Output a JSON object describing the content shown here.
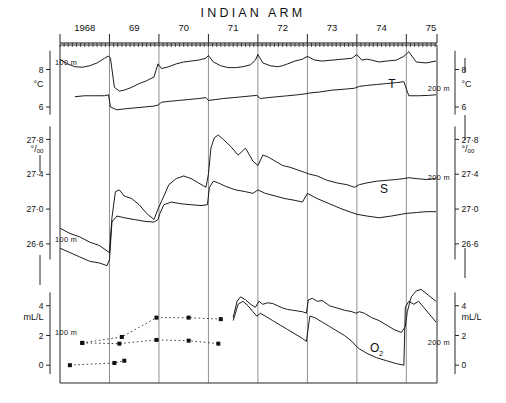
{
  "figure": {
    "title": "INDIAN ARM",
    "panel_labels": {
      "temperature": "T",
      "salinity": "S",
      "oxygen": "O",
      "oxygen_sub": "2"
    },
    "depth_labels": {
      "shallow": "100 m",
      "deep": "200 m"
    }
  },
  "chart_data": {
    "type": "line",
    "title": "INDIAN ARM",
    "xlabel": "",
    "ylabel": "",
    "grid": false,
    "legend": "none",
    "x_axis": {
      "tick_labels": [
        "1968",
        "69",
        "70",
        "71",
        "72",
        "73",
        "74",
        "75"
      ],
      "minor_ticks": "monthly",
      "range": [
        "1968.0",
        "1975.6"
      ]
    },
    "panels": [
      {
        "name": "temperature",
        "label": "T",
        "left_axis": {
          "units": "°C",
          "ticks": [
            "8",
            "6"
          ],
          "depth": "100 m"
        },
        "right_axis": {
          "units": "°C",
          "ticks": [
            "8",
            "6"
          ],
          "depth": "200 m"
        },
        "ylim": [
          5.2,
          9.2
        ],
        "series": [
          {
            "name": "100 m",
            "style": "solid",
            "x": [
              1968.0,
              1968.15,
              1968.3,
              1968.45,
              1968.6,
              1968.75,
              1968.9,
              1968.98,
              1969.02,
              1969.1,
              1969.2,
              1969.3,
              1969.45,
              1969.6,
              1969.75,
              1969.9,
              1969.98,
              1970.05,
              1970.2,
              1970.35,
              1970.5,
              1970.65,
              1970.8,
              1970.95,
              1971.0,
              1971.1,
              1971.25,
              1971.4,
              1971.55,
              1971.7,
              1971.85,
              1971.95,
              1972.0,
              1972.1,
              1972.25,
              1972.4,
              1972.5,
              1972.6,
              1972.75,
              1972.9,
              1973.0,
              1973.15,
              1973.3,
              1973.5,
              1973.7,
              1973.9,
              1974.0,
              1974.1,
              1974.2,
              1974.3,
              1974.45,
              1974.6,
              1974.8,
              1974.95,
              1975.05,
              1975.2,
              1975.4,
              1975.6
            ],
            "y": [
              8.55,
              8.3,
              8.15,
              8.12,
              8.2,
              8.35,
              8.6,
              8.72,
              8.6,
              7.05,
              6.85,
              6.9,
              7.05,
              7.25,
              7.4,
              7.6,
              8.3,
              8.05,
              8.15,
              8.3,
              8.4,
              8.45,
              8.5,
              8.6,
              8.75,
              8.4,
              8.2,
              8.1,
              8.1,
              8.15,
              8.25,
              8.5,
              8.8,
              8.35,
              8.2,
              8.15,
              8.2,
              8.3,
              8.45,
              8.55,
              8.7,
              8.5,
              8.45,
              8.5,
              8.55,
              8.6,
              8.8,
              8.5,
              8.55,
              8.5,
              8.4,
              8.45,
              8.5,
              8.7,
              8.95,
              8.4,
              8.35,
              8.45
            ]
          },
          {
            "name": "200 m",
            "style": "solid",
            "x": [
              1968.3,
              1968.5,
              1968.7,
              1968.9,
              1968.98,
              1969.02,
              1969.15,
              1969.3,
              1969.5,
              1969.7,
              1969.9,
              1969.98,
              1970.05,
              1970.2,
              1970.4,
              1970.6,
              1970.8,
              1970.95,
              1971.0,
              1971.15,
              1971.3,
              1971.5,
              1971.7,
              1971.9,
              1971.98,
              1972.05,
              1972.2,
              1972.4,
              1972.6,
              1972.8,
              1972.95,
              1973.05,
              1973.25,
              1973.5,
              1973.75,
              1973.95,
              1974.05,
              1974.2,
              1974.4,
              1974.6,
              1974.8,
              1974.95,
              1975.05,
              1975.25,
              1975.45,
              1975.6
            ],
            "y": [
              6.55,
              6.6,
              6.6,
              6.6,
              6.65,
              6.0,
              5.85,
              5.9,
              5.95,
              6.0,
              6.05,
              6.1,
              6.25,
              6.3,
              6.35,
              6.4,
              6.45,
              6.5,
              6.35,
              6.4,
              6.45,
              6.5,
              6.55,
              6.6,
              6.62,
              6.45,
              6.5,
              6.55,
              6.6,
              6.65,
              6.7,
              6.75,
              6.8,
              6.9,
              6.95,
              7.0,
              7.1,
              7.15,
              7.2,
              7.25,
              7.3,
              7.35,
              6.6,
              6.6,
              6.62,
              6.65
            ]
          }
        ]
      },
      {
        "name": "salinity",
        "label": "S",
        "left_axis": {
          "units": "°/ₒₒ",
          "ticks": [
            "27·8",
            "27·4",
            "27·0",
            "26·6"
          ],
          "depth": "100 m"
        },
        "right_axis": {
          "units": "°/ₒₒ",
          "ticks": [
            "27·8",
            "27·4",
            "27·0",
            "26·6"
          ],
          "depth": "200 m"
        },
        "ylim": [
          26.3,
          28.0
        ],
        "series": [
          {
            "name": "100 m",
            "style": "solid",
            "x": [
              1968.0,
              1968.2,
              1968.4,
              1968.6,
              1968.8,
              1968.95,
              1969.0,
              1969.05,
              1969.12,
              1969.2,
              1969.3,
              1969.45,
              1969.6,
              1969.75,
              1969.9,
              1969.98,
              1970.02,
              1970.1,
              1970.2,
              1970.35,
              1970.5,
              1970.65,
              1970.8,
              1970.95,
              1971.0,
              1971.05,
              1971.12,
              1971.2,
              1971.3,
              1971.45,
              1971.6,
              1971.75,
              1971.9,
              1972.0,
              1972.1,
              1972.2,
              1972.35,
              1972.5,
              1972.65,
              1972.8,
              1972.95,
              1973.05,
              1973.2,
              1973.4,
              1973.6,
              1973.8,
              1973.95,
              1974.05,
              1974.2,
              1974.4,
              1974.6,
              1974.8,
              1974.95,
              1975.05,
              1975.2,
              1975.4,
              1975.6
            ],
            "y": [
              26.78,
              26.72,
              26.68,
              26.62,
              26.58,
              26.52,
              26.5,
              26.9,
              27.2,
              27.22,
              27.15,
              27.12,
              27.05,
              26.95,
              26.88,
              27.0,
              27.05,
              27.15,
              27.28,
              27.35,
              27.38,
              27.35,
              27.3,
              27.25,
              27.4,
              27.7,
              27.82,
              27.85,
              27.8,
              27.72,
              27.62,
              27.7,
              27.55,
              27.5,
              27.62,
              27.6,
              27.55,
              27.5,
              27.48,
              27.45,
              27.42,
              27.4,
              27.38,
              27.33,
              27.3,
              27.28,
              27.25,
              27.28,
              27.3,
              27.32,
              27.33,
              27.34,
              27.35,
              27.36,
              27.35,
              27.34,
              27.35
            ]
          },
          {
            "name": "200 m",
            "style": "solid",
            "x": [
              1968.0,
              1968.2,
              1968.4,
              1968.6,
              1968.8,
              1968.95,
              1969.0,
              1969.05,
              1969.15,
              1969.3,
              1969.5,
              1969.7,
              1969.9,
              1969.98,
              1970.02,
              1970.1,
              1970.25,
              1970.45,
              1970.65,
              1970.85,
              1970.98,
              1971.02,
              1971.1,
              1971.2,
              1971.35,
              1971.55,
              1971.75,
              1971.9,
              1972.0,
              1972.15,
              1972.35,
              1972.55,
              1972.75,
              1972.9,
              1973.0,
              1973.2,
              1973.45,
              1973.7,
              1973.9,
              1974.0,
              1974.2,
              1974.45,
              1974.7,
              1974.9,
              1975.0,
              1975.2,
              1975.4,
              1975.6
            ],
            "y": [
              26.55,
              26.5,
              26.45,
              26.4,
              26.38,
              26.35,
              26.42,
              26.85,
              26.92,
              26.9,
              26.88,
              26.86,
              26.85,
              26.88,
              26.95,
              27.05,
              27.08,
              27.06,
              27.05,
              27.04,
              27.05,
              27.25,
              27.32,
              27.3,
              27.26,
              27.22,
              27.2,
              27.18,
              27.22,
              27.18,
              27.15,
              27.12,
              27.1,
              27.08,
              27.18,
              27.12,
              27.06,
              27.0,
              26.96,
              26.94,
              26.92,
              26.9,
              26.92,
              26.94,
              26.95,
              26.96,
              26.97,
              26.97
            ]
          }
        ]
      },
      {
        "name": "oxygen",
        "label": "O2",
        "left_axis": {
          "units": "mL/L",
          "ticks": [
            "4",
            "2",
            "0"
          ],
          "depth": "100 m"
        },
        "right_axis": {
          "units": "mL/L",
          "ticks": [
            "4",
            "2",
            "0"
          ],
          "depth": "200 m"
        },
        "ylim": [
          -1.2,
          5.6
        ],
        "series": [
          {
            "name": "100 m early (dotted)",
            "style": "dotted-markers",
            "x": [
              1968.45,
              1969.25,
              1969.95,
              1970.6,
              1971.25
            ],
            "y": [
              1.5,
              1.9,
              3.2,
              3.2,
              3.1
            ]
          },
          {
            "name": "200 m early (dotted)",
            "style": "dotted-markers",
            "x": [
              1968.45,
              1969.2,
              1969.95,
              1970.6,
              1971.2
            ],
            "y": [
              1.5,
              1.45,
              1.7,
              1.65,
              1.45
            ]
          },
          {
            "name": "deep early (dotted)",
            "style": "dotted-markers",
            "x": [
              1968.2,
              1969.1,
              1969.3
            ],
            "y": [
              0.0,
              0.15,
              0.3
            ]
          },
          {
            "name": "100 m",
            "style": "solid",
            "x": [
              1971.5,
              1971.58,
              1971.65,
              1971.75,
              1971.85,
              1971.95,
              1972.02,
              1972.1,
              1972.2,
              1972.3,
              1972.4,
              1972.5,
              1972.6,
              1972.7,
              1972.8,
              1972.9,
              1972.98,
              1973.02,
              1973.1,
              1973.2,
              1973.3,
              1973.45,
              1973.6,
              1973.75,
              1973.9,
              1973.98,
              1974.05,
              1974.15,
              1974.3,
              1974.45,
              1974.6,
              1974.75,
              1974.9,
              1974.98,
              1975.02,
              1975.1,
              1975.2,
              1975.3,
              1975.45,
              1975.6
            ],
            "y": [
              3.2,
              4.3,
              4.6,
              4.4,
              4.1,
              3.9,
              4.3,
              4.1,
              4.2,
              4.15,
              4.0,
              3.85,
              3.75,
              3.7,
              3.65,
              3.6,
              3.5,
              4.4,
              4.5,
              4.3,
              4.35,
              4.0,
              3.85,
              3.7,
              3.6,
              3.5,
              3.6,
              3.5,
              3.2,
              3.0,
              2.7,
              2.4,
              2.2,
              2.6,
              3.6,
              4.6,
              5.0,
              5.1,
              4.7,
              4.3
            ]
          },
          {
            "name": "200 m",
            "style": "solid",
            "x": [
              1971.5,
              1971.6,
              1971.7,
              1971.8,
              1971.9,
              1971.98,
              1972.05,
              1972.15,
              1972.3,
              1972.45,
              1972.6,
              1972.75,
              1972.9,
              1972.98,
              1973.05,
              1973.15,
              1973.3,
              1973.45,
              1973.6,
              1973.75,
              1973.9,
              1973.98,
              1974.05,
              1974.2,
              1974.4,
              1974.6,
              1974.8,
              1974.95,
              1974.98,
              1975.05,
              1975.15,
              1975.25,
              1975.35,
              1975.5,
              1975.6
            ],
            "y": [
              3.0,
              4.1,
              4.3,
              4.0,
              3.6,
              3.3,
              3.5,
              3.3,
              3.0,
              2.7,
              2.4,
              2.1,
              1.8,
              1.6,
              3.3,
              3.2,
              2.9,
              2.6,
              2.3,
              2.0,
              1.6,
              1.3,
              1.1,
              0.8,
              0.5,
              0.3,
              0.1,
              0.0,
              3.9,
              4.3,
              4.1,
              4.3,
              3.9,
              3.3,
              2.9
            ]
          }
        ]
      }
    ]
  }
}
